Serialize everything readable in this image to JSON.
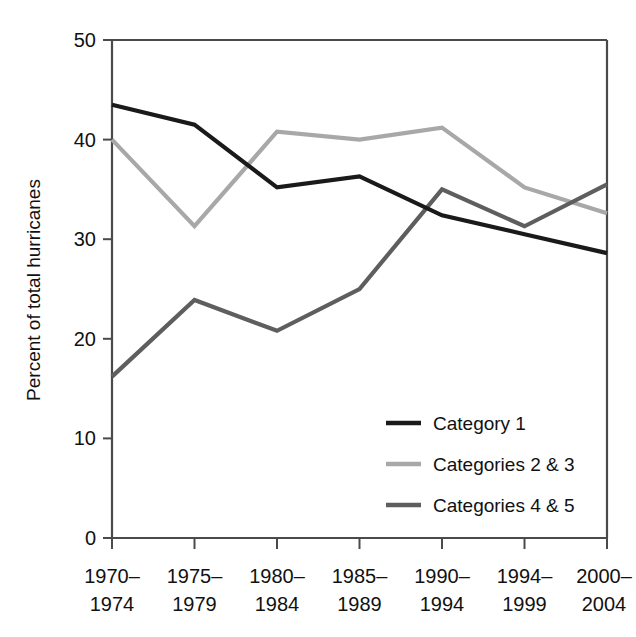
{
  "chart_data": {
    "type": "line",
    "title": "",
    "xlabel": "",
    "ylabel": "Percent of total hurricanes",
    "ylim": [
      0,
      50
    ],
    "yticks": [
      0,
      10,
      20,
      30,
      40,
      50
    ],
    "ytick_labels": [
      "0",
      "10",
      "20",
      "30",
      "40",
      "50"
    ],
    "grid": false,
    "legend_position": "lower right inside plot",
    "categories": [
      "1970–\n1974",
      "1975–\n1979",
      "1980–\n1984",
      "1985–\n1989",
      "1990–\n1994",
      "1994–\n1999",
      "2000–\n2004"
    ],
    "category_lines": [
      [
        "1970–",
        "1974"
      ],
      [
        "1975–",
        "1979"
      ],
      [
        "1980–",
        "1984"
      ],
      [
        "1985–",
        "1989"
      ],
      [
        "1990–",
        "1994"
      ],
      [
        "1994–",
        "1999"
      ],
      [
        "2000–",
        "2004"
      ]
    ],
    "series": [
      {
        "name": "Category 1",
        "color": "#1a1a1a",
        "values": [
          43.5,
          41.5,
          35.2,
          36.3,
          32.4,
          30.5,
          28.6
        ]
      },
      {
        "name": "Categories 2 & 3",
        "color": "#a8a8a8",
        "values": [
          40.0,
          31.3,
          40.8,
          40.0,
          41.2,
          35.2,
          32.6
        ]
      },
      {
        "name": "Categories 4 & 5",
        "color": "#5e5e5e",
        "values": [
          16.2,
          23.9,
          20.8,
          25.0,
          35.0,
          31.3,
          35.5
        ]
      }
    ]
  },
  "axes": {
    "y_title": "Percent of total hurricanes",
    "y_tick_0": "0",
    "y_tick_10": "10",
    "y_tick_20": "20",
    "y_tick_30": "30",
    "y_tick_40": "40",
    "y_tick_50": "50"
  },
  "xaxis": {
    "t0_top": "1970–",
    "t0_bottom": "1974",
    "t1_top": "1975–",
    "t1_bottom": "1979",
    "t2_top": "1980–",
    "t2_bottom": "1984",
    "t3_top": "1985–",
    "t3_bottom": "1989",
    "t4_top": "1990–",
    "t4_bottom": "1994",
    "t5_top": "1994–",
    "t5_bottom": "1999",
    "t6_top": "2000–",
    "t6_bottom": "2004"
  },
  "legend": {
    "item_0": "Category 1",
    "item_1": "Categories 2 & 3",
    "item_2": "Categories 4 & 5"
  },
  "colors": {
    "category_1": "#1a1a1a",
    "categories_2_3": "#a8a8a8",
    "categories_4_5": "#5e5e5e",
    "axis": "#4a4a4a",
    "background": "#ffffff"
  }
}
